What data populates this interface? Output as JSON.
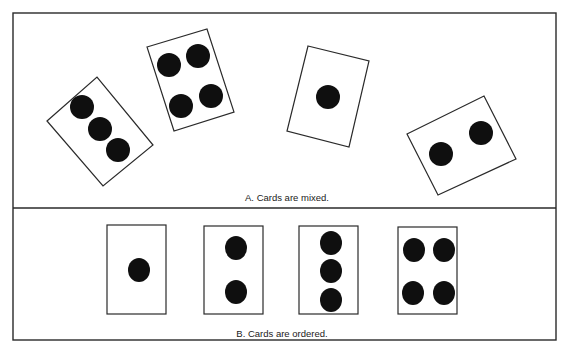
{
  "figure": {
    "colors": {
      "ink": "#0f0f0f",
      "line": "#2a2a2a",
      "background": "#ffffff"
    },
    "panels": [
      {
        "id": "A",
        "caption": "A.  Cards are mixed.",
        "cards": [
          {
            "pips": 3,
            "arrangement": "rotated"
          },
          {
            "pips": 4,
            "arrangement": "rotated"
          },
          {
            "pips": 1,
            "arrangement": "rotated"
          },
          {
            "pips": 2,
            "arrangement": "rotated"
          }
        ]
      },
      {
        "id": "B",
        "caption": "B.  Cards are ordered.",
        "cards": [
          {
            "pips": 1,
            "arrangement": "upright"
          },
          {
            "pips": 2,
            "arrangement": "upright"
          },
          {
            "pips": 3,
            "arrangement": "upright"
          },
          {
            "pips": 4,
            "arrangement": "upright"
          }
        ]
      }
    ]
  }
}
